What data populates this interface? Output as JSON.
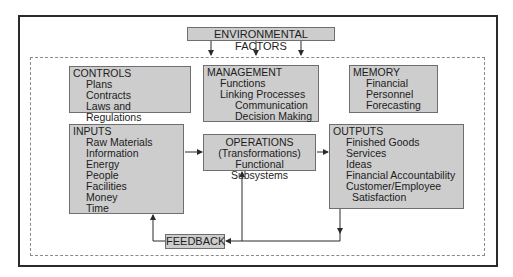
{
  "environment": {
    "label": "ENVIRONMENTAL FACTORS"
  },
  "controls": {
    "title": "CONTROLS",
    "items": [
      "Plans",
      "Contracts",
      "Laws and Regulations"
    ]
  },
  "management": {
    "title": "MANAGEMENT",
    "items": [
      "Functions",
      "Linking Processes"
    ],
    "subitems": [
      "Communication",
      "Decision Making"
    ]
  },
  "memory": {
    "title": "MEMORY",
    "items": [
      "Financial",
      "Personnel",
      "Forecasting"
    ]
  },
  "inputs": {
    "title": "INPUTS",
    "items": [
      "Raw Materials",
      "Information",
      "Energy",
      "People",
      "Facilities",
      "Money",
      "Time"
    ]
  },
  "operations": {
    "lines": [
      "OPERATIONS",
      "(Transformations)",
      "Functional Subsystems"
    ]
  },
  "outputs": {
    "title": "OUTPUTS",
    "items": [
      "Finished Goods",
      "Services",
      "Ideas",
      "Financial Accountability",
      "Customer/Employee"
    ],
    "continuation": "Satisfaction"
  },
  "feedback": {
    "label": "FEEDBACK"
  },
  "colors": {
    "box_fill": "#cdcdcd",
    "box_border": "#6e6e6e",
    "frame": "#2a2a2a",
    "dashed": "#8a8a8a"
  }
}
